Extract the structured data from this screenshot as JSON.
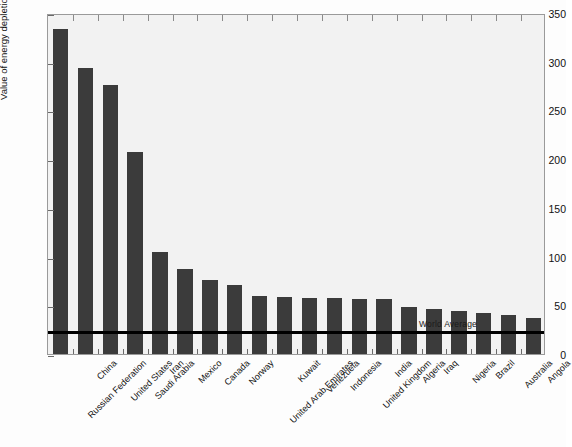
{
  "chart_data": {
    "type": "bar",
    "title": "",
    "xlabel": "",
    "ylabel": "Value of energy depletion (billion USD)",
    "ylim": [
      0,
      350
    ],
    "yticks": [
      0,
      50,
      100,
      150,
      200,
      250,
      300,
      350
    ],
    "grid": false,
    "legend": null,
    "categories": [
      "Russian Federation",
      "China",
      "United States",
      "Saudi Arabia",
      "Iran",
      "Mexico",
      "Canada",
      "Norway",
      "United Arab Emirates",
      "Kuwait",
      "Venezuela",
      "Indonesia",
      "United Kingdom",
      "India",
      "Algeria",
      "Iraq",
      "Nigeria",
      "Brazil",
      "Australia",
      "Angola"
    ],
    "values": [
      334,
      294,
      276,
      207,
      105,
      87,
      76,
      71,
      60,
      59,
      58,
      57,
      56,
      56,
      48,
      46,
      44,
      42,
      40,
      37
    ],
    "annotations": [
      {
        "label": "World Average",
        "type": "hline",
        "value": 25
      }
    ],
    "series_color": "#3b3b3b",
    "annotation_color": "#000000",
    "plot_background": "#f2f2f2"
  }
}
